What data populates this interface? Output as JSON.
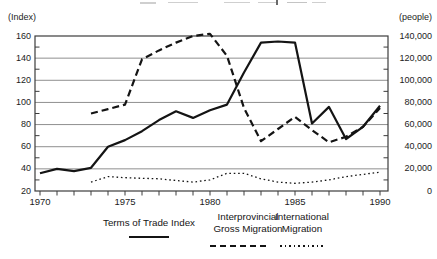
{
  "colors": {
    "ink": "#141414",
    "grid": "#8f8f8f",
    "frame": "#3c3c3c",
    "background": "#ffffff"
  },
  "chart_data": {
    "type": "line",
    "title": "",
    "grid": "horizontal",
    "legend_position": "bottom",
    "left_axis": {
      "unit_label": "(Index)",
      "range": [
        20,
        160
      ],
      "ticks": [
        160,
        140,
        120,
        100,
        80,
        60,
        40,
        20
      ]
    },
    "right_axis": {
      "unit_label": "(people)",
      "range": [
        0,
        140000
      ],
      "ticks": [
        {
          "value": 140000,
          "label": "140,000"
        },
        {
          "value": 120000,
          "label": "120,000"
        },
        {
          "value": 100000,
          "label": "100,000"
        },
        {
          "value": 80000,
          "label": "80,000"
        },
        {
          "value": 60000,
          "label": "60,000"
        },
        {
          "value": 40000,
          "label": "40,000"
        },
        {
          "value": 20000,
          "label": "20,000"
        },
        {
          "value": 0,
          "label": "0"
        }
      ]
    },
    "x_axis": {
      "start": 1970,
      "end": 1990,
      "tick_interval": 1,
      "labeled_ticks": [
        1970,
        1975,
        1980,
        1985,
        1990
      ]
    },
    "series": [
      {
        "name": "Terms of Trade Index",
        "axis": "left",
        "line_style": "solid",
        "start_year": 1970,
        "values": [
          36,
          40,
          38,
          41,
          60,
          66,
          74,
          84,
          92,
          86,
          93,
          98,
          127,
          154,
          155,
          154,
          81,
          96,
          67,
          78,
          97
        ]
      },
      {
        "name": "Interprovincial Gross Migration",
        "axis": "right",
        "line_style": "dashed",
        "start_year": 1973,
        "values": [
          70000,
          74000,
          78000,
          119000,
          127000,
          134000,
          140000,
          142000,
          122000,
          75000,
          45000,
          56000,
          67000,
          55000,
          44000,
          49000,
          58000,
          75000
        ]
      },
      {
        "name": "International Migration",
        "axis": "right",
        "line_style": "dotted",
        "start_year": 1973,
        "values": [
          8000,
          13000,
          12000,
          11500,
          11000,
          9500,
          8000,
          10000,
          16000,
          16000,
          11000,
          8000,
          7000,
          8000,
          10000,
          13000,
          15000,
          17000
        ]
      }
    ]
  }
}
